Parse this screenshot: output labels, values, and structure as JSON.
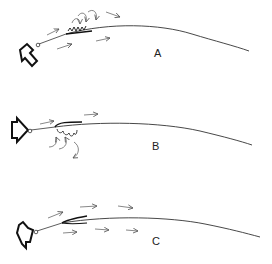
{
  "diagram": {
    "type": "airflow-over-sail-luff",
    "panels": [
      {
        "id": "A",
        "label": "A",
        "description": "Flow separation with eddies on leeward side near luff"
      },
      {
        "id": "B",
        "label": "B",
        "description": "Flow separation with eddies on windward side near luff"
      },
      {
        "id": "C",
        "label": "C",
        "description": "Smooth attached flow on both sides"
      }
    ],
    "colors": {
      "stroke": "#222222",
      "arrow": "#555555",
      "background": "#ffffff"
    }
  }
}
